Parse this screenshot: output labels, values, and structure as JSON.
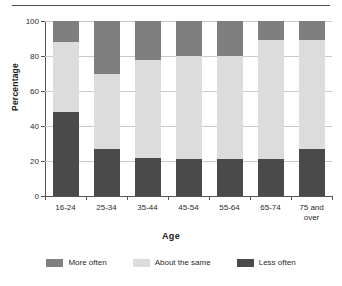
{
  "chart_data": {
    "type": "bar",
    "subtype": "stacked-column-100",
    "title": "",
    "xlabel": "Age",
    "ylabel": "Percentage",
    "ylim": [
      0,
      100
    ],
    "yticks": [
      0,
      20,
      40,
      60,
      80,
      100
    ],
    "ytick_labels": [
      "0",
      "20",
      "40",
      "60",
      "80",
      "100"
    ],
    "grid": true,
    "legend_position": "bottom",
    "categories": [
      "16-24",
      "25-34",
      "35-44",
      "45-54",
      "55-64",
      "65-74",
      "75 and over"
    ],
    "category_lines": [
      [
        "16-24"
      ],
      [
        "25-34"
      ],
      [
        "35-44"
      ],
      [
        "45-54"
      ],
      [
        "55-64"
      ],
      [
        "65-74"
      ],
      [
        "75 and",
        "over"
      ]
    ],
    "series": [
      {
        "name": "Less often",
        "color": "#4a4a4a",
        "values": [
          48,
          27,
          22,
          21,
          21,
          21,
          27
        ]
      },
      {
        "name": "About the same",
        "color": "#dcdcdc",
        "values": [
          40,
          43,
          56,
          59,
          59,
          68,
          62
        ]
      },
      {
        "name": "More often",
        "color": "#7f7f7f",
        "values": [
          12,
          30,
          22,
          20,
          20,
          11,
          11
        ]
      }
    ],
    "stack_order_bottom_to_top": [
      "Less often",
      "About the same",
      "More often"
    ]
  },
  "legend": {
    "items": [
      {
        "label": "More often",
        "color": "#7f7f7f",
        "swatch": "legend-swatch-more-often"
      },
      {
        "label": "About the same",
        "color": "#dcdcdc",
        "swatch": "legend-swatch-about-the-same"
      },
      {
        "label": "Less often",
        "color": "#4a4a4a",
        "swatch": "legend-swatch-less-often"
      }
    ]
  }
}
